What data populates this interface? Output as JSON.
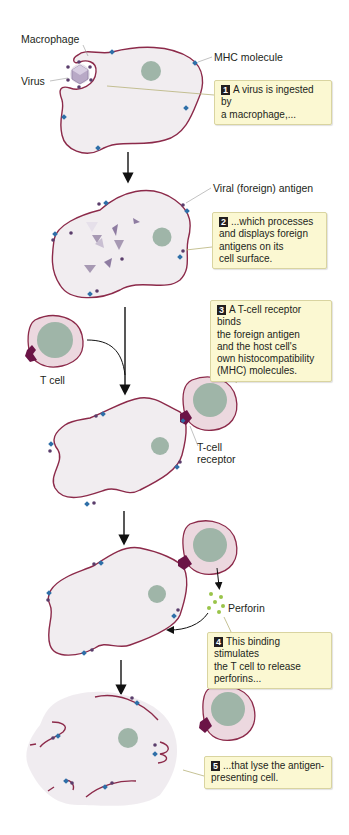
{
  "labels": {
    "macrophage": "Macrophage",
    "virus": "Virus",
    "mhc_molecule": "MHC molecule",
    "viral_antigen": "Viral (foreign) antigen",
    "t_cell": "T cell",
    "t_cell_receptor_line1": "T-cell",
    "t_cell_receptor_line2": "receptor",
    "perforin": "Perforin"
  },
  "steps": [
    {
      "number": "1",
      "text": "A virus is ingested by\na macrophage,..."
    },
    {
      "number": "2",
      "text": "...which processes\nand displays foreign\nantigens on its\ncell surface."
    },
    {
      "number": "3",
      "text": "A T-cell receptor binds\nthe foreign antigen\nand the host cell's\nown histocompatibility\n(MHC) molecules."
    },
    {
      "number": "4",
      "text": "This binding stimulates\nthe T cell to release\nperforins..."
    },
    {
      "number": "5",
      "text": "...that lyse the antigen-\npresenting cell."
    }
  ],
  "colors": {
    "membrane": "#8c2a4a",
    "cytoplasm": "#f1edf0",
    "nucleus": "#9fb5a8",
    "mhc": "#2e6fa8",
    "antigen": "#5a3d6b",
    "receptor": "#6b1446",
    "perforin": "#9ac44a",
    "callout_bg": "#fbf8d2"
  }
}
